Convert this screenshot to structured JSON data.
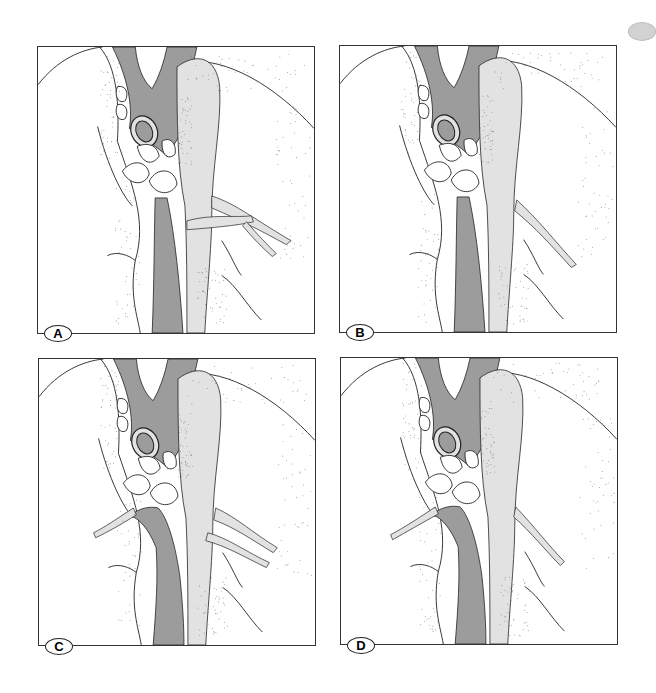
{
  "figure": {
    "panels": [
      {
        "id": "A",
        "label": "A",
        "variant": "both-branches-right"
      },
      {
        "id": "B",
        "label": "B",
        "variant": "single-branch-right"
      },
      {
        "id": "C",
        "label": "C",
        "variant": "bifurcation-both-sides"
      },
      {
        "id": "D",
        "label": "D",
        "variant": "bifurcation-single-right"
      }
    ],
    "colors": {
      "vessel_dark": "#9c9c9c",
      "vessel_light": "#e2e2e2",
      "line": "#222222",
      "stipple": "#777777",
      "tab": "#d2d2d2"
    }
  }
}
